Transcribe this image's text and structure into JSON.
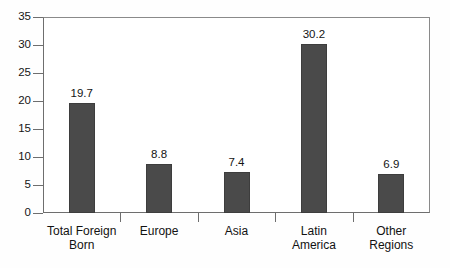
{
  "chart_data": {
    "type": "bar",
    "title": "",
    "subtitle": "",
    "xlabel": "",
    "ylabel": "",
    "categories": [
      "Total Foreign\nBorn",
      "Europe",
      "Asia",
      "Latin\nAmerica",
      "Other\nRegions"
    ],
    "values": [
      19.7,
      8.8,
      7.4,
      30.2,
      6.9
    ],
    "value_labels": [
      "19.7",
      "8.8",
      "7.4",
      "30.2",
      "6.9"
    ],
    "ylim": [
      0,
      35
    ],
    "yticks": [
      0,
      5,
      10,
      15,
      20,
      25,
      30,
      35
    ],
    "ytick_labels": [
      "0",
      "5",
      "10",
      "15",
      "20",
      "25",
      "30",
      "35"
    ],
    "grid": false,
    "legend": false,
    "bar_color": "#4a4a4a",
    "axis_color": "#6e6e6e",
    "background": "#ffffff"
  }
}
